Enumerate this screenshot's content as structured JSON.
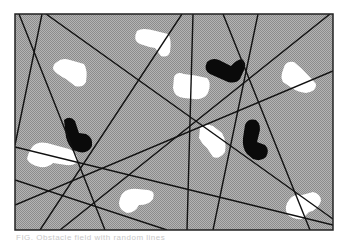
{
  "figure": {
    "frame": {
      "x": 15,
      "y": 14,
      "width": 318,
      "height": 216
    },
    "colors": {
      "background": "#a9a9a9",
      "dither_dark": "#8f8f8f",
      "white_obstacle": "#ffffff",
      "black_obstacle": "#0a0a0a",
      "lines": "#111111",
      "frame_border": "#222222"
    },
    "lines": [
      [
        19,
        14,
        105,
        230
      ],
      [
        42,
        14,
        15,
        145
      ],
      [
        46,
        14,
        333,
        219
      ],
      [
        182,
        14,
        40,
        230
      ],
      [
        193,
        14,
        187,
        230
      ],
      [
        223,
        14,
        310,
        230
      ],
      [
        258,
        14,
        213,
        230
      ],
      [
        15,
        147,
        333,
        225
      ],
      [
        15,
        205,
        333,
        71
      ],
      [
        15,
        180,
        167,
        230
      ],
      [
        60,
        230,
        330,
        14
      ]
    ],
    "white_obstacles": [
      {
        "label": "white-blob-top-center",
        "d": "M137 31 Q142 27 156 31 L168 34 Q172 39 170 52 Q168 58 161 56 L155 48 Q148 47 140 44 Q132 40 137 31 Z"
      },
      {
        "label": "white-blob-left-upper",
        "d": "M57 62 Q62 57 70 60 L84 64 Q88 70 86 82 Q83 88 75 86 L66 79 Q56 74 53 69 Q53 64 57 62 Z"
      },
      {
        "label": "white-blob-center",
        "d": "M174 77 Q177 71 184 74 Q195 75 207 78 Q212 83 208 93 Q204 100 194 99 L184 98 Q174 97 173 88 Z"
      },
      {
        "label": "white-blob-right-upper",
        "d": "M283 70 Q285 60 294 62 L301 68 Q310 77 316 84 Q317 91 306 93 Q297 92 292 88 L283 82 Q280 77 283 70 Z"
      },
      {
        "label": "white-blob-left-lower",
        "d": "M33 146 Q38 141 47 143 L69 149 Q77 152 78 160 Q77 166 66 165 L53 163 Q48 168 40 167 Q30 165 27 159 Q29 150 33 146 Z"
      },
      {
        "label": "white-blob-center-lower",
        "d": "M200 128 Q204 122 213 126 L222 133 Q227 142 225 152 Q219 160 213 157 L207 148 Q202 144 199 138 Z"
      },
      {
        "label": "white-blob-bottom-center",
        "d": "M123 193 Q128 188 138 189 L148 190 Q156 191 153 199 Q149 205 139 205 Q135 213 127 213 Q119 210 119 203 Q120 196 123 193 Z"
      },
      {
        "label": "white-blob-bottom-right",
        "d": "M289 200 Q293 194 302 195 L313 192 Q321 194 321 201 Q318 210 309 212 L302 219 Q293 220 287 214 Q284 206 289 200 Z"
      }
    ],
    "black_obstacles": [
      {
        "label": "black-L-top-right",
        "d": "M207 62 Q212 57 219 60 L231 66 Q236 60 242 59 Q246 62 245 68 L240 79 Q236 84 228 82 L210 74 Q203 70 207 62 Z"
      },
      {
        "label": "black-L-left",
        "d": "M64 120 Q70 115 75 121 L79 133 L86 134 Q93 137 92 146 Q88 154 79 152 L73 150 Q68 145 66 137 Z"
      },
      {
        "label": "black-L-right",
        "d": "M245 125 Q248 118 256 120 Q262 125 259 134 L257 142 L265 145 Q270 150 266 157 Q261 162 253 159 L247 154 Q242 148 243 138 Z"
      }
    ]
  },
  "caption": {
    "text": "FIG. Obstacle field with random lines"
  }
}
